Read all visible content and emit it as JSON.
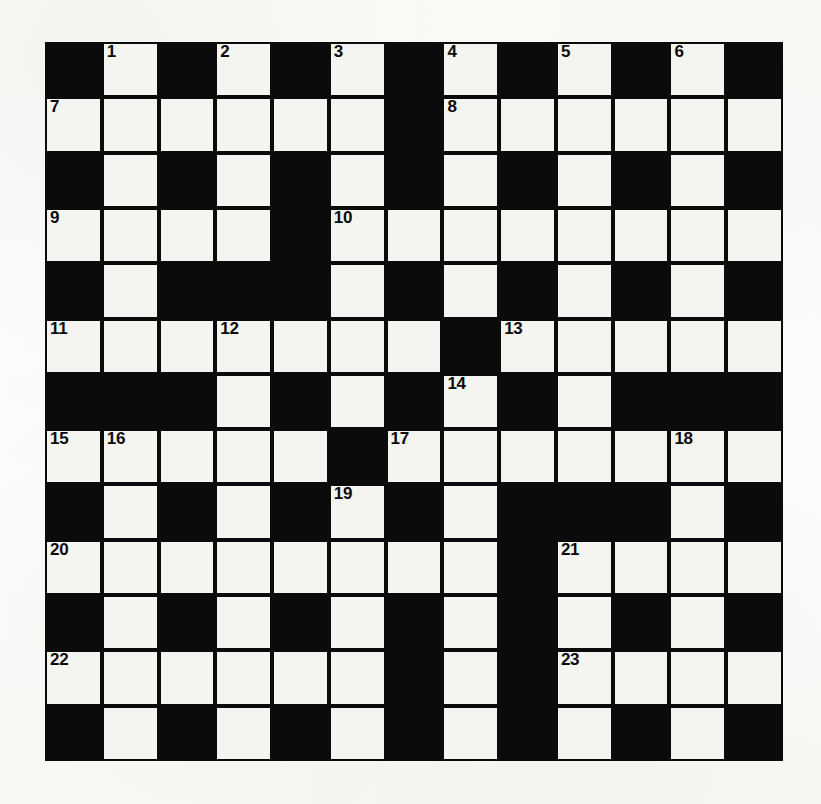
{
  "puzzle": {
    "type": "crossword-grid",
    "title": "",
    "rows": 13,
    "columns": 13,
    "colors": {
      "block": "#0b0b0b",
      "cell": "#f4f4f1",
      "number": "#0b0b0b",
      "paper": "#fdfdfb"
    },
    "legend": {
      "white": 1,
      "black": 0
    },
    "grid": [
      [
        0,
        1,
        0,
        1,
        0,
        1,
        0,
        1,
        0,
        1,
        0,
        1,
        0
      ],
      [
        1,
        1,
        1,
        1,
        1,
        1,
        0,
        1,
        1,
        1,
        1,
        1,
        1
      ],
      [
        0,
        1,
        0,
        1,
        0,
        1,
        0,
        1,
        0,
        1,
        0,
        1,
        0
      ],
      [
        1,
        1,
        1,
        1,
        0,
        1,
        1,
        1,
        1,
        1,
        1,
        1,
        1
      ],
      [
        0,
        1,
        0,
        0,
        0,
        1,
        0,
        1,
        0,
        1,
        0,
        1,
        0
      ],
      [
        1,
        1,
        1,
        1,
        1,
        1,
        1,
        0,
        1,
        1,
        1,
        1,
        1
      ],
      [
        0,
        0,
        0,
        1,
        0,
        1,
        0,
        1,
        0,
        1,
        0,
        0,
        0
      ],
      [
        1,
        1,
        1,
        1,
        1,
        0,
        1,
        1,
        1,
        1,
        1,
        1,
        1
      ],
      [
        0,
        1,
        0,
        1,
        0,
        1,
        0,
        1,
        0,
        0,
        0,
        1,
        0
      ],
      [
        1,
        1,
        1,
        1,
        1,
        1,
        1,
        1,
        0,
        1,
        1,
        1,
        1
      ],
      [
        0,
        1,
        0,
        1,
        0,
        1,
        0,
        1,
        0,
        1,
        0,
        1,
        0
      ],
      [
        1,
        1,
        1,
        1,
        1,
        1,
        0,
        1,
        0,
        1,
        1,
        1,
        1
      ],
      [
        0,
        1,
        0,
        1,
        0,
        1,
        0,
        1,
        0,
        1,
        0,
        1,
        0
      ]
    ],
    "numbers": [
      {
        "n": "1",
        "row": 0,
        "col": 1
      },
      {
        "n": "2",
        "row": 0,
        "col": 3
      },
      {
        "n": "3",
        "row": 0,
        "col": 5
      },
      {
        "n": "4",
        "row": 0,
        "col": 7
      },
      {
        "n": "5",
        "row": 0,
        "col": 9
      },
      {
        "n": "6",
        "row": 0,
        "col": 11
      },
      {
        "n": "7",
        "row": 1,
        "col": 0
      },
      {
        "n": "8",
        "row": 1,
        "col": 7
      },
      {
        "n": "9",
        "row": 3,
        "col": 0
      },
      {
        "n": "10",
        "row": 3,
        "col": 5
      },
      {
        "n": "11",
        "row": 5,
        "col": 0
      },
      {
        "n": "12",
        "row": 5,
        "col": 3
      },
      {
        "n": "13",
        "row": 5,
        "col": 8
      },
      {
        "n": "14",
        "row": 6,
        "col": 7
      },
      {
        "n": "15",
        "row": 7,
        "col": 0
      },
      {
        "n": "16",
        "row": 7,
        "col": 1
      },
      {
        "n": "17",
        "row": 7,
        "col": 6
      },
      {
        "n": "18",
        "row": 7,
        "col": 11
      },
      {
        "n": "19",
        "row": 8,
        "col": 5
      },
      {
        "n": "20",
        "row": 9,
        "col": 0
      },
      {
        "n": "21",
        "row": 9,
        "col": 9
      },
      {
        "n": "22",
        "row": 11,
        "col": 0
      },
      {
        "n": "23",
        "row": 11,
        "col": 9
      }
    ],
    "entries": []
  }
}
